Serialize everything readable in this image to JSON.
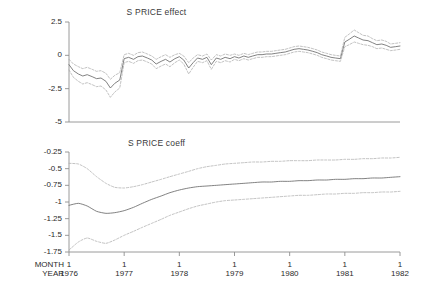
{
  "figure": {
    "axis_labels": {
      "month": "MONTH",
      "year": "YEAR"
    }
  },
  "chart_data": [
    {
      "type": "line",
      "title": "S PRICE effect",
      "xlabel": "",
      "ylabel": "",
      "ylim": [
        -5,
        2.5
      ],
      "xlim": [
        1976.0,
        1982.0
      ],
      "grid": false,
      "legend": "none",
      "yticks": [
        2.5,
        0,
        -2.5,
        -5
      ],
      "ytick_labels": [
        "2.5",
        "0",
        "-2.5",
        "-5"
      ],
      "xticks": [
        1976,
        1977,
        1978,
        1979,
        1980,
        1981,
        1982
      ],
      "xtick_labels": [
        "1",
        "1",
        "1",
        "1",
        "1",
        "1",
        "1"
      ],
      "xtick_year_labels": [
        "1976",
        "1977",
        "1978",
        "1979",
        "1980",
        "1981",
        "1982"
      ],
      "x": [
        1976.0,
        1976.08,
        1976.17,
        1976.25,
        1976.33,
        1976.42,
        1976.5,
        1976.58,
        1976.67,
        1976.75,
        1976.83,
        1976.92,
        1977.0,
        1977.08,
        1977.17,
        1977.25,
        1977.33,
        1977.42,
        1977.5,
        1977.58,
        1977.67,
        1977.75,
        1977.83,
        1977.92,
        1978.0,
        1978.08,
        1978.17,
        1978.25,
        1978.33,
        1978.42,
        1978.5,
        1978.58,
        1978.67,
        1978.75,
        1978.83,
        1978.92,
        1979.0,
        1979.08,
        1979.17,
        1979.25,
        1979.33,
        1979.42,
        1979.5,
        1979.58,
        1979.67,
        1979.75,
        1979.83,
        1979.92,
        1980.0,
        1980.08,
        1980.17,
        1980.25,
        1980.33,
        1980.42,
        1980.5,
        1980.58,
        1980.67,
        1980.75,
        1980.83,
        1980.92,
        1981.0,
        1981.08,
        1981.17,
        1981.25,
        1981.33,
        1981.42,
        1981.5,
        1981.58,
        1981.67,
        1981.75,
        1981.83,
        1981.92,
        1982.0
      ],
      "series": [
        {
          "name": "effect",
          "style": "solid",
          "values": [
            -0.7,
            -1.15,
            -1.4,
            -1.55,
            -1.45,
            -1.6,
            -1.75,
            -1.7,
            -1.95,
            -2.45,
            -2.1,
            -1.85,
            -0.25,
            -0.15,
            -0.3,
            -0.1,
            -0.05,
            -0.2,
            -0.35,
            -0.65,
            -0.45,
            -0.3,
            -0.5,
            -0.25,
            -0.1,
            -0.35,
            -0.95,
            -0.55,
            -0.2,
            -0.3,
            -0.15,
            -0.7,
            -0.2,
            -0.3,
            -0.15,
            -0.25,
            -0.1,
            -0.2,
            -0.05,
            -0.15,
            -0.05,
            0.05,
            0.05,
            0.1,
            0.1,
            0.15,
            0.2,
            0.25,
            0.35,
            0.45,
            0.5,
            0.45,
            0.4,
            0.3,
            0.2,
            0.05,
            -0.05,
            -0.15,
            -0.2,
            -0.25,
            1.0,
            1.2,
            1.45,
            1.3,
            1.15,
            1.1,
            0.95,
            0.8,
            0.85,
            0.75,
            0.6,
            0.65,
            0.7
          ]
        },
        {
          "name": "upper-band",
          "style": "dashed",
          "values": [
            -0.3,
            -0.65,
            -0.85,
            -1.0,
            -0.9,
            -1.05,
            -1.2,
            -1.15,
            -1.35,
            -1.8,
            -1.5,
            -1.3,
            0.05,
            0.15,
            0.0,
            0.2,
            0.25,
            0.1,
            -0.05,
            -0.3,
            -0.1,
            0.05,
            -0.15,
            0.05,
            0.15,
            -0.05,
            -0.55,
            -0.2,
            0.05,
            -0.05,
            0.1,
            -0.35,
            0.05,
            -0.05,
            0.1,
            0.0,
            0.1,
            0.0,
            0.15,
            0.05,
            0.15,
            0.25,
            0.25,
            0.3,
            0.3,
            0.35,
            0.4,
            0.45,
            0.55,
            0.65,
            0.7,
            0.65,
            0.6,
            0.5,
            0.4,
            0.25,
            0.15,
            0.05,
            0.0,
            -0.05,
            1.35,
            1.6,
            1.9,
            1.7,
            1.5,
            1.45,
            1.25,
            1.1,
            1.15,
            1.05,
            0.85,
            0.9,
            0.95
          ]
        },
        {
          "name": "lower-band",
          "style": "dashed",
          "values": [
            -1.1,
            -1.65,
            -1.95,
            -2.15,
            -2.05,
            -2.2,
            -2.35,
            -2.3,
            -2.6,
            -3.15,
            -2.75,
            -2.45,
            -0.55,
            -0.45,
            -0.6,
            -0.4,
            -0.35,
            -0.5,
            -0.65,
            -1.0,
            -0.8,
            -0.65,
            -0.85,
            -0.55,
            -0.35,
            -0.65,
            -1.4,
            -0.9,
            -0.45,
            -0.55,
            -0.4,
            -1.05,
            -0.45,
            -0.55,
            -0.4,
            -0.5,
            -0.3,
            -0.4,
            -0.25,
            -0.35,
            -0.25,
            -0.15,
            -0.15,
            -0.1,
            -0.1,
            -0.05,
            0.0,
            0.05,
            0.15,
            0.25,
            0.3,
            0.25,
            0.2,
            0.1,
            0.0,
            -0.15,
            -0.25,
            -0.35,
            -0.4,
            -0.45,
            0.65,
            0.8,
            1.0,
            0.9,
            0.8,
            0.75,
            0.65,
            0.5,
            0.55,
            0.45,
            0.35,
            0.4,
            0.45
          ]
        }
      ]
    },
    {
      "type": "line",
      "title": "S PRICE coeff",
      "xlabel": "",
      "ylabel": "",
      "ylim": [
        -1.75,
        -0.25
      ],
      "xlim": [
        1976.0,
        1982.0
      ],
      "grid": false,
      "legend": "none",
      "yticks": [
        -0.25,
        -0.5,
        -0.75,
        -1,
        -1.25,
        -1.5,
        -1.75
      ],
      "ytick_labels": [
        "-0.25",
        "-0.5",
        "-0.75",
        "-1",
        "-1.25",
        "-1.5",
        "-1.75"
      ],
      "xticks": [
        1976,
        1977,
        1978,
        1979,
        1980,
        1981,
        1982
      ],
      "xtick_labels": [
        "1",
        "1",
        "1",
        "1",
        "1",
        "1",
        "1"
      ],
      "xtick_year_labels": [
        "1976",
        "1977",
        "1978",
        "1979",
        "1980",
        "1981",
        "1982"
      ],
      "x": [
        1976.0,
        1976.17,
        1976.33,
        1976.5,
        1976.67,
        1976.83,
        1977.0,
        1977.17,
        1977.33,
        1977.5,
        1977.67,
        1977.83,
        1978.0,
        1978.17,
        1978.33,
        1978.5,
        1978.67,
        1978.83,
        1979.0,
        1979.17,
        1979.33,
        1979.5,
        1979.67,
        1979.83,
        1980.0,
        1980.17,
        1980.33,
        1980.5,
        1980.67,
        1980.83,
        1981.0,
        1981.17,
        1981.33,
        1981.5,
        1981.67,
        1981.83,
        1982.0
      ],
      "series": [
        {
          "name": "coefficient",
          "style": "solid",
          "values": [
            -1.05,
            -1.02,
            -1.06,
            -1.14,
            -1.17,
            -1.16,
            -1.13,
            -1.08,
            -1.02,
            -0.96,
            -0.91,
            -0.86,
            -0.82,
            -0.79,
            -0.77,
            -0.76,
            -0.75,
            -0.74,
            -0.73,
            -0.72,
            -0.71,
            -0.7,
            -0.7,
            -0.69,
            -0.69,
            -0.68,
            -0.68,
            -0.67,
            -0.67,
            -0.66,
            -0.66,
            -0.65,
            -0.65,
            -0.64,
            -0.64,
            -0.63,
            -0.62
          ]
        },
        {
          "name": "upper-ci",
          "style": "dashed",
          "values": [
            -0.42,
            -0.43,
            -0.5,
            -0.62,
            -0.72,
            -0.78,
            -0.79,
            -0.77,
            -0.74,
            -0.7,
            -0.66,
            -0.62,
            -0.58,
            -0.54,
            -0.5,
            -0.47,
            -0.45,
            -0.43,
            -0.42,
            -0.41,
            -0.4,
            -0.4,
            -0.39,
            -0.39,
            -0.38,
            -0.38,
            -0.38,
            -0.37,
            -0.37,
            -0.37,
            -0.36,
            -0.36,
            -0.35,
            -0.35,
            -0.34,
            -0.34,
            -0.33
          ]
        },
        {
          "name": "lower-ci",
          "style": "dashed",
          "values": [
            -1.72,
            -1.6,
            -1.54,
            -1.59,
            -1.62,
            -1.57,
            -1.5,
            -1.44,
            -1.38,
            -1.32,
            -1.26,
            -1.2,
            -1.15,
            -1.1,
            -1.06,
            -1.03,
            -1.0,
            -0.98,
            -0.97,
            -0.96,
            -0.95,
            -0.94,
            -0.93,
            -0.92,
            -0.91,
            -0.9,
            -0.9,
            -0.89,
            -0.88,
            -0.88,
            -0.87,
            -0.87,
            -0.86,
            -0.86,
            -0.85,
            -0.85,
            -0.84
          ]
        }
      ]
    }
  ]
}
